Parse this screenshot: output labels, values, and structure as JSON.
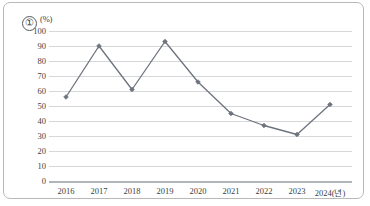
{
  "figure": {
    "item_marker": "①",
    "unit_label": "(%)",
    "border_color": "#b9b9b9"
  },
  "chart_data": {
    "type": "line",
    "title": "",
    "subtitle": "",
    "xlabel": "",
    "ylabel": "(%)",
    "x_axis_suffix_label": "2024(년)",
    "categories": [
      "2016",
      "2017",
      "2018",
      "2019",
      "2020",
      "2021",
      "2022",
      "2023",
      "2024"
    ],
    "x_tick_labels": [
      "2016",
      "2017",
      "2018",
      "2019",
      "2020",
      "2021",
      "2022",
      "2023",
      "2024(년)"
    ],
    "values": [
      56,
      90,
      61,
      93,
      66,
      45,
      37,
      31,
      51
    ],
    "series": [
      {
        "name": "",
        "values": [
          56,
          90,
          61,
          93,
          66,
          45,
          37,
          31,
          51
        ],
        "color": "#6d737e",
        "marker": "diamond"
      }
    ],
    "ylim": [
      0,
      100
    ],
    "y_tick_step": 10,
    "y_tick_labels": [
      "0",
      "10",
      "20",
      "30",
      "40",
      "50",
      "60",
      "70",
      "80",
      "90",
      "100"
    ],
    "grid": true,
    "grid_color": "#d5d7da",
    "legend": false,
    "legend_position": "none",
    "annotations": []
  }
}
